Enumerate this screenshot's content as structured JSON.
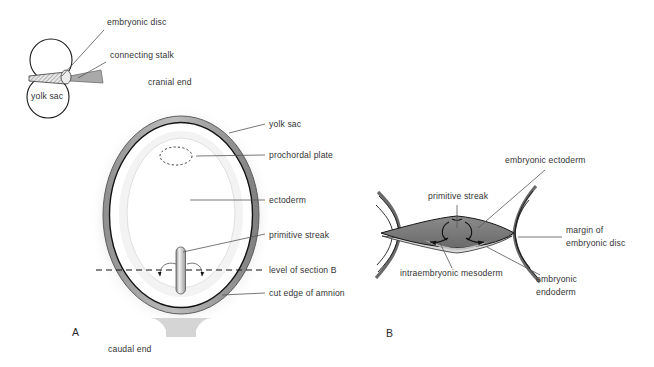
{
  "figure": {
    "panels": [
      {
        "id": "panel-a",
        "label": "A",
        "x": 72,
        "y": 336
      },
      {
        "id": "panel-b",
        "label": "B",
        "x": 386,
        "y": 337
      }
    ]
  },
  "colors": {
    "background": "#ffffff",
    "outline": "#1a1a1a",
    "text": "#333333",
    "leader": "#555555",
    "yolk_sac_halo": "#e3e3e3",
    "amnion_ring": "#9a9a9a",
    "amnion_ring_dark": "#6e6e6e",
    "cavity_fill": "#ffffff",
    "mesoderm_fill": "#7d7d7d",
    "ectoderm_fill": "#c9c9c9",
    "stalk_fill": "#a8a8a8",
    "disc_fill": "#d8d8d8"
  },
  "inset": {
    "name": "amnion-yolk-sac-inset",
    "labels": [
      {
        "id": "embryonic-disc",
        "text": "embryonic disc",
        "x": 107,
        "y": 25
      },
      {
        "id": "connecting-stalk",
        "text": "connecting stalk",
        "x": 110,
        "y": 58
      },
      {
        "id": "yolk-sac-inset",
        "text": "yolk sac",
        "x": 35,
        "y": 99
      }
    ]
  },
  "panel_a": {
    "name": "embryonic-disc-dorsal-view",
    "labels": [
      {
        "id": "cranial-end",
        "text": "cranial end",
        "x": 148,
        "y": 85,
        "leader": false
      },
      {
        "id": "yolk-sac",
        "text": "yolk sac",
        "x": 269,
        "y": 127,
        "leader": true
      },
      {
        "id": "prochordal-plate",
        "text": "prochordal plate",
        "x": 269,
        "y": 158,
        "leader": true
      },
      {
        "id": "ectoderm",
        "text": "ectoderm",
        "x": 269,
        "y": 203,
        "leader": true
      },
      {
        "id": "primitive-streak",
        "text": "primitive streak",
        "x": 269,
        "y": 238,
        "leader": true
      },
      {
        "id": "level-of-section-b",
        "text": "level of section B",
        "x": 269,
        "y": 272,
        "leader": true
      },
      {
        "id": "cut-edge-of-amnion",
        "text": "cut edge of amnion",
        "x": 269,
        "y": 296,
        "leader": true
      },
      {
        "id": "caudal-end",
        "text": "caudal end",
        "x": 126,
        "y": 352,
        "leader": false
      }
    ]
  },
  "panel_b": {
    "name": "embryonic-disc-cross-section",
    "labels": [
      {
        "id": "embryonic-ectoderm",
        "text": "embryonic ectoderm",
        "x": 505,
        "y": 163
      },
      {
        "id": "primitive-streak-b",
        "text": "primitive streak",
        "x": 430,
        "y": 199
      },
      {
        "id": "margin-of",
        "text": "margin of",
        "x": 566,
        "y": 233
      },
      {
        "id": "embryonic-disc-b",
        "text": "embryonic disc",
        "x": 566,
        "y": 245
      },
      {
        "id": "intraembryonic-mesoderm",
        "text": "intraembryonic mesoderm",
        "x": 403,
        "y": 275
      },
      {
        "id": "embryonic-endoderm-1",
        "text": "embryonic",
        "x": 566,
        "y": 280
      },
      {
        "id": "embryonic-endoderm-2",
        "text": "endoderm",
        "x": 566,
        "y": 293
      }
    ]
  }
}
